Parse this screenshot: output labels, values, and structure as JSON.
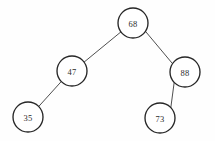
{
  "figure": {
    "name": "binary-search-tree",
    "background_color": "#ffffff",
    "node_fill": "#ffffff",
    "node_stroke": "#262626",
    "edge_stroke": "#3b3b3b",
    "label_color": "#2b2b2b",
    "width": 215,
    "height": 141
  },
  "tree": {
    "root_value": "68",
    "nodes": [
      {
        "id": "n68",
        "label": "68",
        "cx": 133,
        "cy": 23,
        "r": 15,
        "level": 0,
        "role": "root"
      },
      {
        "id": "n47",
        "label": "47",
        "cx": 72,
        "cy": 71,
        "r": 15,
        "level": 1,
        "role": "left-child"
      },
      {
        "id": "n88",
        "label": "88",
        "cx": 185,
        "cy": 72,
        "r": 15,
        "level": 1,
        "role": "right-child"
      },
      {
        "id": "n35",
        "label": "35",
        "cx": 28,
        "cy": 117,
        "r": 15,
        "level": 2,
        "role": "left-child"
      },
      {
        "id": "n73",
        "label": "73",
        "cx": 160,
        "cy": 118,
        "r": 15,
        "level": 2,
        "role": "left-child"
      }
    ],
    "edges": [
      {
        "id": "e68-47",
        "from": "n68",
        "to": "n47",
        "x1": 120.9,
        "y1": 31.9,
        "x2": 84.1,
        "y2": 62.1
      },
      {
        "id": "e68-88",
        "from": "n68",
        "to": "n88",
        "x1": 145.6,
        "y1": 31.5,
        "x2": 172.4,
        "y2": 63.5
      },
      {
        "id": "e47-35",
        "from": "n47",
        "to": "n35",
        "x1": 61.3,
        "y1": 81.5,
        "x2": 38.7,
        "y2": 106.5
      },
      {
        "id": "e88-73",
        "from": "n88",
        "to": "n73",
        "x1": 174.2,
        "y1": 82.2,
        "x2": 170.8,
        "y2": 107.8
      }
    ]
  }
}
